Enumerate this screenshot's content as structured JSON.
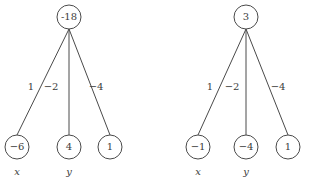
{
  "figure": {
    "type": "computational-graph-pair",
    "background_color": "#ffffff",
    "stroke_color": "#4a4a4a",
    "text_color": "#3c3c3c"
  },
  "graphs": [
    {
      "id": "left-graph",
      "root": {
        "value": "-18",
        "cx": 69,
        "cy": 17,
        "r": 12
      },
      "edges": [
        {
          "label": "1",
          "lx": 31,
          "ly": 87,
          "x1": 69,
          "y1": 29,
          "x2": 17,
          "y2": 135
        },
        {
          "label": "−2",
          "lx": 51,
          "ly": 87,
          "x1": 69,
          "y1": 29,
          "x2": 69,
          "y2": 135
        },
        {
          "label": "−4",
          "lx": 96,
          "ly": 87,
          "x1": 69,
          "y1": 29,
          "x2": 110,
          "y2": 135
        }
      ],
      "leaves": [
        {
          "value": "−6",
          "cx": 17,
          "cy": 147,
          "r": 12,
          "var": "x",
          "vx": 17,
          "vy": 172
        },
        {
          "value": "4",
          "cx": 69,
          "cy": 147,
          "r": 12,
          "var": "y",
          "vx": 69,
          "vy": 172
        },
        {
          "value": "1",
          "cx": 110,
          "cy": 147,
          "r": 12,
          "var": "",
          "vx": 110,
          "vy": 172
        }
      ]
    },
    {
      "id": "right-graph",
      "root": {
        "value": "3",
        "cx": 246,
        "cy": 17,
        "r": 12
      },
      "edges": [
        {
          "label": "1",
          "lx": 210,
          "ly": 87,
          "x1": 246,
          "y1": 29,
          "x2": 198,
          "y2": 135
        },
        {
          "label": "−2",
          "lx": 232,
          "ly": 87,
          "x1": 246,
          "y1": 29,
          "x2": 246,
          "y2": 135
        },
        {
          "label": "−4",
          "lx": 278,
          "ly": 87,
          "x1": 246,
          "y1": 29,
          "x2": 288,
          "y2": 135
        }
      ],
      "leaves": [
        {
          "value": "−1",
          "cx": 198,
          "cy": 147,
          "r": 12,
          "var": "x",
          "vx": 198,
          "vy": 172
        },
        {
          "value": "−4",
          "cx": 246,
          "cy": 147,
          "r": 12,
          "var": "y",
          "vx": 246,
          "vy": 172
        },
        {
          "value": "1",
          "cx": 288,
          "cy": 147,
          "r": 12,
          "var": "",
          "vx": 288,
          "vy": 172
        }
      ]
    }
  ]
}
